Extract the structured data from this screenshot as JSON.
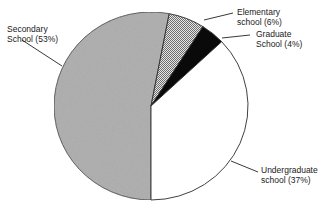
{
  "chart_data": {
    "type": "pie",
    "title": "",
    "start_angle_deg": 180,
    "direction": "clockwise",
    "slices": [
      {
        "name": "Secondary School",
        "value": 53,
        "label_line1": "Secondary",
        "label_line2": "School (53%)",
        "fill": "#a9a9a9",
        "pattern": "noise"
      },
      {
        "name": "Elementary school",
        "value": 6,
        "label_line1": "Elementary",
        "label_line2": "school (6%)",
        "fill": "#c4c4c4",
        "pattern": "crosshatch"
      },
      {
        "name": "Graduate School",
        "value": 4,
        "label_line1": "Graduate",
        "label_line2": "School (4%)",
        "fill": "#0a0a0a",
        "pattern": "solid"
      },
      {
        "name": "Undergraduate school",
        "value": 37,
        "label_line1": "Undergraduate",
        "label_line2": "school (37%)",
        "fill": "#ffffff",
        "pattern": "solid"
      }
    ],
    "categories": [
      "Secondary School",
      "Elementary school",
      "Graduate School",
      "Undergraduate school"
    ],
    "values": [
      53,
      6,
      4,
      37
    ],
    "units": "%",
    "legend": "none (direct leader-line labels)"
  },
  "labels": {
    "secondary": {
      "line1": "Secondary",
      "line2": "School (53%)"
    },
    "elementary": {
      "line1": "Elementary",
      "line2": "school (6%)"
    },
    "graduate": {
      "line1": "Graduate",
      "line2": "School (4%)"
    },
    "undergraduate": {
      "line1": "Undergraduate",
      "line2": "school (37%)"
    }
  }
}
